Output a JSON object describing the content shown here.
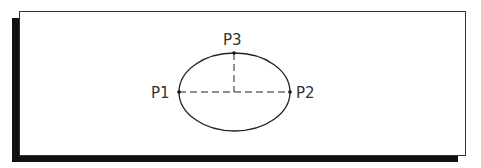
{
  "diagram": {
    "colors": {
      "stroke": "#222222",
      "text": "#333333",
      "shadow": "#111111",
      "background": "#ffffff"
    },
    "ellipse": {
      "cx": 234.5,
      "cy": 92,
      "rx": 55.5,
      "ry": 39
    },
    "points": [
      {
        "id": "p1",
        "label": "P1",
        "x": 179,
        "y": 92
      },
      {
        "id": "p2",
        "label": "P2",
        "x": 290,
        "y": 92
      },
      {
        "id": "p3",
        "label": "P3",
        "x": 234,
        "y": 53
      }
    ],
    "axes": {
      "major_axis": {
        "from": "P1",
        "to": "P2",
        "style": "dashed"
      },
      "minor_half_axis": {
        "from": "P3",
        "to": "center",
        "style": "dashed"
      }
    }
  }
}
